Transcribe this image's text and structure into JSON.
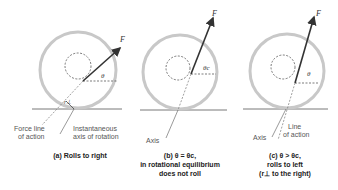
{
  "panels": [
    {
      "id": "a",
      "caption_lines": [
        "(a) Rolls to right"
      ],
      "force_label": "F",
      "angle_label": "θ",
      "perp_label": "r⊥",
      "annotations": [
        "Force line",
        "of action",
        "Instantaneous",
        "axis of rotation"
      ]
    },
    {
      "id": "b",
      "caption_lines": [
        "(b) θ = θc,",
        "in rotational equilibrium",
        "does not roll"
      ],
      "force_label": "F",
      "angle_label": "θc",
      "annotations": [
        "Axis"
      ]
    },
    {
      "id": "c",
      "caption_lines": [
        "(c) θ > θc,",
        "rolls to left",
        "(r⊥ to the right)"
      ],
      "force_label": "F",
      "angle_label": "θ",
      "annotations": [
        "Axis",
        "Line",
        "of action"
      ]
    }
  ],
  "colors": {
    "wheel": "#c8c8c8",
    "line": "#333333",
    "text": "#555555"
  }
}
